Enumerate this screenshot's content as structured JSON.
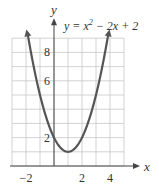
{
  "chart_data": {
    "type": "line",
    "equation_parts": {
      "lhs": "y = x",
      "sup": "2",
      "rest": " − 2x + 2"
    },
    "xlabel": "x",
    "ylabel": "y",
    "xlim": [
      -3,
      5
    ],
    "ylim": [
      0,
      9
    ],
    "x_ticks": [
      {
        "v": -2,
        "label": "−2"
      },
      {
        "v": 2,
        "label": "2"
      },
      {
        "v": 4,
        "label": "4"
      }
    ],
    "y_ticks": [
      {
        "v": 2,
        "label": "2"
      },
      {
        "v": 6,
        "label": "6"
      },
      {
        "v": 8,
        "label": "8"
      }
    ],
    "grid": true,
    "grid_step": 1,
    "series": [
      {
        "name": "y = x^2 - 2x + 2",
        "color": "#555555",
        "x": [
          -1.9,
          -1.5,
          -1,
          -0.5,
          0,
          0.5,
          1,
          1.5,
          2,
          2.5,
          3,
          3.5,
          3.9
        ],
        "y": [
          9.41,
          7.25,
          5,
          3.25,
          2,
          1.25,
          1,
          1.25,
          2,
          3.25,
          5,
          7.25,
          9.41
        ]
      }
    ],
    "vertex": [
      1,
      1
    ],
    "arrows_on_ends": true
  }
}
